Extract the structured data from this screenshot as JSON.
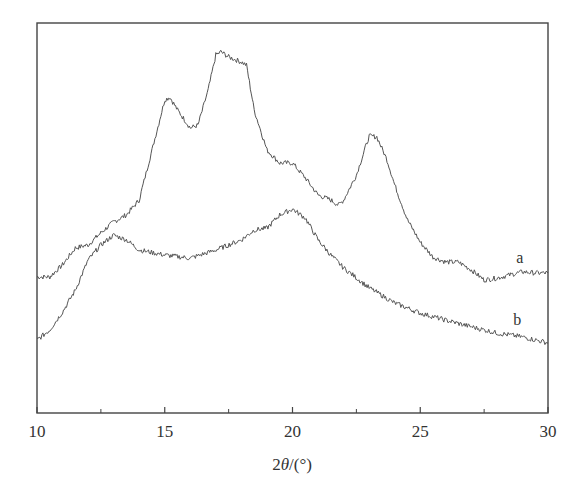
{
  "chart_data": {
    "type": "line",
    "title": "",
    "xlabel": "2θ/(°)",
    "xlabel_parts": {
      "prefix": "2",
      "symbol": "θ",
      "suffix": "/(°)"
    },
    "ylabel": "",
    "xlim": [
      10,
      30
    ],
    "ylim": [
      0,
      100
    ],
    "y_ticks_shown": false,
    "grid": false,
    "legend": "inline curve labels",
    "x_ticks": {
      "major": [
        10,
        15,
        20,
        25,
        30
      ],
      "minor": [
        12.5,
        17.5,
        22.5,
        27.5
      ],
      "labels": [
        "10",
        "15",
        "20",
        "25",
        "30"
      ]
    },
    "series": [
      {
        "name": "a",
        "label_pos": {
          "x": 28.9,
          "y": 38.5
        },
        "x": [
          10,
          10.5,
          11,
          11.5,
          12,
          12.5,
          13,
          13.5,
          14,
          14.5,
          15,
          15.2,
          15.5,
          16,
          16.3,
          16.7,
          17,
          17.2,
          17.5,
          18,
          18.2,
          18.5,
          19,
          19.5,
          20,
          20.5,
          21,
          21.5,
          21.8,
          22,
          22.5,
          23,
          23.3,
          23.7,
          24,
          24.5,
          25,
          25.5,
          26,
          26.5,
          27,
          27.5,
          28,
          28.5,
          29,
          29.5,
          30
        ],
        "values": [
          34.9,
          34.9,
          38.0,
          42.3,
          43.1,
          46.2,
          49.0,
          50.8,
          54.6,
          67.4,
          80.3,
          81.0,
          77.7,
          73.1,
          73.8,
          82.8,
          91.8,
          92.6,
          91.3,
          90.0,
          89.2,
          77.7,
          67.4,
          64.1,
          64.1,
          60.3,
          55.9,
          54.6,
          53.3,
          54.6,
          61.0,
          71.0,
          70.8,
          64.9,
          58.5,
          49.5,
          43.8,
          39.99,
          38.7,
          38.7,
          36.7,
          34.1,
          34.6,
          35.4,
          36.2,
          35.9,
          35.9
        ]
      },
      {
        "name": "b",
        "label_pos": {
          "x": 28.8,
          "y": 22.6
        },
        "x": [
          10,
          10.5,
          11,
          11.5,
          12,
          12.5,
          13,
          13.5,
          14,
          15,
          16,
          17,
          18,
          18.5,
          19,
          19.5,
          20,
          20.5,
          21,
          21.5,
          22,
          23,
          24,
          25,
          26,
          27,
          28,
          29,
          30
        ],
        "values": [
          18.7,
          21.3,
          25.9,
          31.5,
          39.2,
          43.1,
          45.6,
          44.4,
          41.8,
          40.5,
          39.7,
          41.8,
          44.4,
          46.9,
          47.4,
          50.8,
          52.3,
          50.0,
          44.4,
          40.5,
          37.2,
          32.1,
          28.2,
          25.6,
          23.8,
          22.1,
          20.5,
          19.5,
          18.0
        ]
      }
    ],
    "styles": {
      "line_color": "#555555",
      "axis_color": "#444444",
      "text_color": "#333333"
    }
  }
}
